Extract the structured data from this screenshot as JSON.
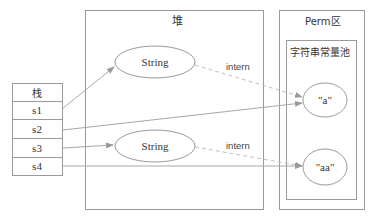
{
  "diagram": {
    "type": "memory-layout",
    "colors": {
      "line": "#9a9a9a",
      "dashed": "#bbbbbb",
      "text": "#333333",
      "background": "#ffffff"
    },
    "stack": {
      "title": "栈",
      "rows": [
        "s1",
        "s2",
        "s3",
        "s4"
      ]
    },
    "heap": {
      "title": "堆",
      "objects": [
        {
          "label": "String"
        },
        {
          "label": "String"
        }
      ]
    },
    "perm": {
      "title": "Perm区",
      "pool": {
        "title": "字符串常量池",
        "entries": [
          {
            "label": "\"a\""
          },
          {
            "label": "\"aa\""
          }
        ]
      }
    },
    "edges": [
      {
        "from": "s1",
        "to": "heap.String#1",
        "style": "solid",
        "label": ""
      },
      {
        "from": "s2",
        "to": "pool.\"a\"",
        "style": "solid",
        "label": ""
      },
      {
        "from": "s3",
        "to": "heap.String#2",
        "style": "solid",
        "label": ""
      },
      {
        "from": "s4",
        "to": "pool.\"aa\"",
        "style": "solid",
        "label": ""
      },
      {
        "from": "heap.String#1",
        "to": "pool.\"a\"",
        "style": "dashed",
        "label": "intern"
      },
      {
        "from": "heap.String#2",
        "to": "pool.\"aa\"",
        "style": "dashed",
        "label": "intern"
      }
    ],
    "edge_labels": {
      "intern_top": "intern",
      "intern_bottom": "intern"
    }
  }
}
